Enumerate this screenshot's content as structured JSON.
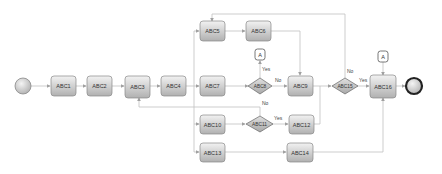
{
  "diagram": {
    "type": "bpmn-process-flow",
    "colors": {
      "line": "#b8b8b8",
      "arrow": "#a0a0a0",
      "task_fill_top": "#f0f0f0",
      "task_fill_bottom": "#b4b4b4",
      "task_stroke": "#888888",
      "gateway_fill": "#c4c4c4",
      "end_stroke": "#222222"
    },
    "events": {
      "start": {
        "label": ""
      },
      "end": {
        "label": ""
      }
    },
    "tasks": {
      "abc1": "ABC1",
      "abc2": "ABC2",
      "abc3": "ABC3",
      "abc4": "ABC4",
      "abc5": "ABC5",
      "abc6": "ABC6",
      "abc7": "ABC7",
      "abc9": "ABC9",
      "abc10": "ABC10",
      "abc12": "ABC12",
      "abc13": "ABC13",
      "abc14": "ABC14",
      "abc16": "ABC16"
    },
    "gateways": {
      "abc8": "ABC8",
      "abc11": "ABC11",
      "abc15": "ABC15"
    },
    "connectors": {
      "a1": "A",
      "a2": "A"
    },
    "edge_labels": {
      "abc8_yes": "Yes",
      "abc8_no": "No",
      "abc11_yes": "Yes",
      "abc11_no": "No",
      "abc15_yes": "Yes",
      "abc15_no": "No"
    }
  }
}
